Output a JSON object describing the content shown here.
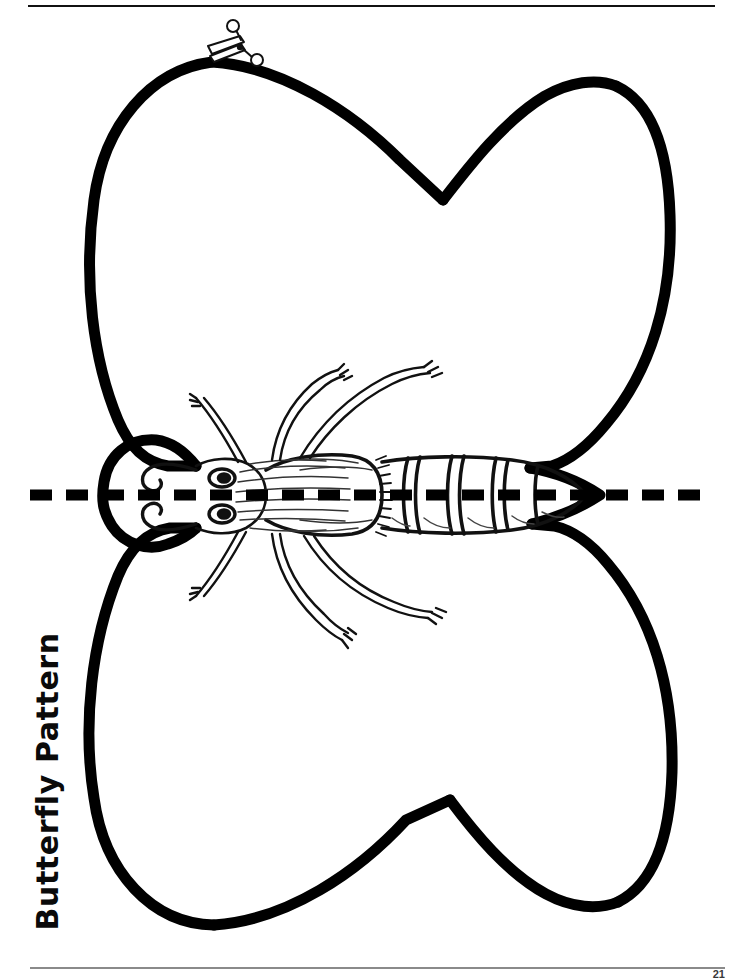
{
  "page": {
    "title": "Butterfly Pattern",
    "page_number": "21",
    "background_color": "#ffffff",
    "ink_color": "#000000",
    "width": 731,
    "height": 979
  },
  "header": {
    "top_rule": true
  },
  "footer": {
    "bottom_rule": true,
    "page_number": "21"
  },
  "artwork": {
    "subject": "butterfly-cut-out-pattern",
    "description": "Black outline butterfly pattern with four heart-lobed wings, detailed insect body, and a horizontal dashed fold line",
    "icons": [
      {
        "name": "scissors-icon",
        "label": "cut line marker",
        "x": 230,
        "y": 46
      }
    ],
    "fold_line": {
      "name": "dashed-fold-line",
      "orientation": "horizontal",
      "y": 495,
      "x_start": 30,
      "x_end": 712,
      "dash_length": 22,
      "gap_length": 14,
      "thickness": 11,
      "color": "#000000"
    },
    "wings": {
      "count": 4,
      "upper_notch_x": 443,
      "upper_notch_y": 200,
      "lower_notch_x": 450,
      "lower_notch_y": 800,
      "left_edge_x": 103,
      "right_tip_x": 604,
      "top_edge_y": 62,
      "bottom_edge_y": 925
    },
    "body": {
      "head_x": 150,
      "thorax_x": 300,
      "abdomen_segments": 6,
      "legs": 6,
      "eyes": 2,
      "tail_tip_x": 596
    }
  }
}
